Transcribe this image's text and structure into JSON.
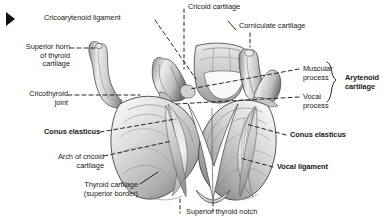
{
  "figure": {
    "marker": "corner-triangle-marker",
    "palette": {
      "background": "#ffffff",
      "text": "#1a1a1a",
      "leader_line": "#111111",
      "cartilage_light": "#f2f2f2",
      "cartilage_mid": "#c9c9c9",
      "cartilage_dark": "#8d8d8d",
      "shadow": "#4a4a4a",
      "outline": "#2a2a2a"
    }
  },
  "labels": [
    {
      "id": "cricoarytenoid-ligament",
      "text": "Cricoarytenoid ligament",
      "bold": false,
      "align": "left",
      "x": 44,
      "y": 14
    },
    {
      "id": "cricoid-cartilage",
      "text": "Cricoid cartilage",
      "bold": false,
      "align": "left",
      "x": 188,
      "y": 3
    },
    {
      "id": "corniculate-cartilage",
      "text": "Corniculate cartilage",
      "bold": false,
      "align": "left",
      "x": 239,
      "y": 22
    },
    {
      "id": "superior-horn-of-thyroid-cartilage",
      "text": "Superior horn\nof thyroid\ncartilage",
      "bold": false,
      "align": "right",
      "x": 8,
      "y": 43
    },
    {
      "id": "cricothyroid-joint",
      "text": "Cricothyroid\njoint",
      "bold": false,
      "align": "right",
      "x": 14,
      "y": 90
    },
    {
      "id": "muscular-process",
      "text": "Muscular\nprocess",
      "bold": false,
      "align": "left",
      "x": 303,
      "y": 65
    },
    {
      "id": "vocal-process",
      "text": "Vocal\nprocess",
      "bold": false,
      "align": "left",
      "x": 303,
      "y": 93
    },
    {
      "id": "arytenoid-cartilage",
      "text": "Arytenoid\ncartilage",
      "bold": true,
      "align": "left",
      "x": 345,
      "y": 79
    },
    {
      "id": "conus-elasticus-left",
      "text": "Conus elasticus",
      "bold": true,
      "align": "right",
      "x": 6,
      "y": 128
    },
    {
      "id": "conus-elasticus-right",
      "text": "Conus elasticus",
      "bold": true,
      "align": "left",
      "x": 290,
      "y": 131
    },
    {
      "id": "arch-of-cricoid-cartilage",
      "text": "Arch of cricoid\ncartilage",
      "bold": false,
      "align": "right",
      "x": 26,
      "y": 153
    },
    {
      "id": "vocal-ligament",
      "text": "Vocal ligament",
      "bold": true,
      "align": "left",
      "x": 277,
      "y": 163
    },
    {
      "id": "thyroid-cartilage-superior-border",
      "text": "Thyroid cartilage\n(superior border)",
      "bold": false,
      "align": "right",
      "x": 46,
      "y": 181
    },
    {
      "id": "superior-thyroid-notch",
      "text": "Superior thyroid notch",
      "bold": false,
      "align": "left",
      "x": 186,
      "y": 208
    }
  ]
}
